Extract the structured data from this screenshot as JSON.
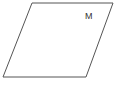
{
  "diagram": {
    "shape": "parallelogram",
    "vertices": [
      [
        32,
        3
      ],
      [
        113,
        3
      ],
      [
        86,
        77
      ],
      [
        3,
        77
      ]
    ],
    "label": "M",
    "stroke_color": "#555555",
    "fill_color": "#ffffff"
  }
}
